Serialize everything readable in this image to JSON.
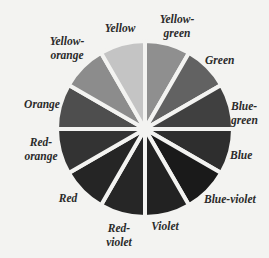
{
  "wheel": {
    "center": [
      145,
      129
    ],
    "radius": 88,
    "gap_color": "#f3f3f1",
    "segments": [
      {
        "name": "Yellow-green",
        "start": 0,
        "end": 30,
        "fill": "#8f8f8f"
      },
      {
        "name": "Green",
        "start": 30,
        "end": 60,
        "fill": "#626262"
      },
      {
        "name": "Blue-green",
        "start": 60,
        "end": 90,
        "fill": "#404040"
      },
      {
        "name": "Blue",
        "start": 90,
        "end": 120,
        "fill": "#2e2e2e"
      },
      {
        "name": "Blue-violet",
        "start": 120,
        "end": 150,
        "fill": "#1a1a1a"
      },
      {
        "name": "Violet",
        "start": 150,
        "end": 180,
        "fill": "#222222"
      },
      {
        "name": "Red-violet",
        "start": 180,
        "end": 210,
        "fill": "#262626"
      },
      {
        "name": "Red",
        "start": 210,
        "end": 240,
        "fill": "#252525"
      },
      {
        "name": "Red-orange",
        "start": 240,
        "end": 270,
        "fill": "#333333"
      },
      {
        "name": "Orange",
        "start": 270,
        "end": 300,
        "fill": "#4e4e4e"
      },
      {
        "name": "Yellow-orange",
        "start": 300,
        "end": 330,
        "fill": "#8c8c8c"
      },
      {
        "name": "Yellow",
        "start": 330,
        "end": 360,
        "fill": "#c4c4c4"
      }
    ]
  },
  "labels": [
    {
      "lines": [
        "Yellow"
      ],
      "x": 120,
      "y": 32,
      "anchor": "middle"
    },
    {
      "lines": [
        "Yellow-",
        "green"
      ],
      "x": 177,
      "y": 23,
      "anchor": "middle"
    },
    {
      "lines": [
        "Green"
      ],
      "x": 205,
      "y": 64,
      "anchor": "start"
    },
    {
      "lines": [
        "Blue-",
        "green"
      ],
      "x": 231,
      "y": 110,
      "anchor": "start"
    },
    {
      "lines": [
        "Blue"
      ],
      "x": 230,
      "y": 159,
      "anchor": "start"
    },
    {
      "lines": [
        "Blue-violet"
      ],
      "x": 204,
      "y": 203,
      "anchor": "start"
    },
    {
      "lines": [
        "Violet"
      ],
      "x": 165,
      "y": 230,
      "anchor": "middle"
    },
    {
      "lines": [
        "Red-",
        "violet"
      ],
      "x": 119,
      "y": 232,
      "anchor": "middle"
    },
    {
      "lines": [
        "Red"
      ],
      "x": 68,
      "y": 202,
      "anchor": "middle"
    },
    {
      "lines": [
        "Red-",
        "orange"
      ],
      "x": 41,
      "y": 146,
      "anchor": "middle"
    },
    {
      "lines": [
        "Orange"
      ],
      "x": 42,
      "y": 108,
      "anchor": "middle"
    },
    {
      "lines": [
        "Yellow-",
        "orange"
      ],
      "x": 67,
      "y": 45,
      "anchor": "middle"
    }
  ]
}
